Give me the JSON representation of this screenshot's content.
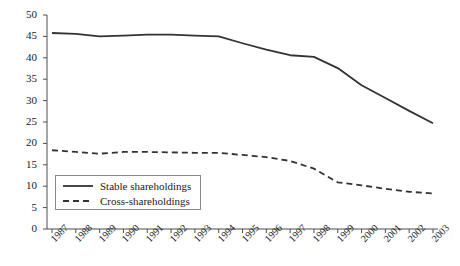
{
  "chart_data": {
    "type": "line",
    "title": "",
    "subtitle": "",
    "xlabel": "",
    "ylabel": "",
    "xlim": [
      1987,
      2003
    ],
    "ylim": [
      0,
      50
    ],
    "grid": false,
    "legend_position": "bottom-left",
    "categories": [
      "1987",
      "1988",
      "1989",
      "1990",
      "1991",
      "1992",
      "1993",
      "1994",
      "1995",
      "1996",
      "1997",
      "1998",
      "1999",
      "2000",
      "2001",
      "2002",
      "2003"
    ],
    "yticks": [
      0,
      5,
      10,
      15,
      20,
      25,
      30,
      35,
      40,
      45,
      50
    ],
    "series": [
      {
        "name": "Stable shareholdings",
        "style": "solid",
        "color": "#333333",
        "values": [
          45.8,
          45.6,
          45.0,
          45.2,
          45.4,
          45.4,
          45.2,
          45.0,
          43.4,
          41.9,
          40.6,
          40.2,
          37.6,
          33.6,
          30.6,
          27.6,
          24.7
        ]
      },
      {
        "name": "Cross-shareholdings",
        "style": "dashed",
        "color": "#333333",
        "values": [
          18.4,
          18.0,
          17.6,
          18.0,
          18.0,
          17.9,
          17.8,
          17.8,
          17.3,
          16.8,
          15.9,
          14.1,
          10.9,
          10.2,
          9.4,
          8.7,
          8.3
        ]
      }
    ]
  },
  "axis": {
    "color": "#4d4d4d"
  }
}
